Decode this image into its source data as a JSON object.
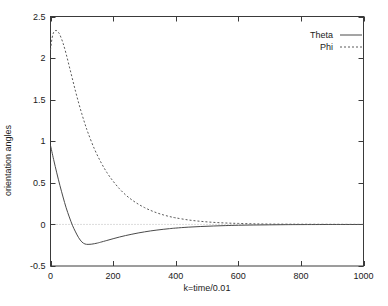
{
  "chart_data": {
    "type": "line",
    "title": "",
    "xlabel": "k=time/0.01",
    "ylabel": "orientation angles",
    "xlim": [
      0,
      1000
    ],
    "ylim": [
      -0.5,
      2.5
    ],
    "xticks": [
      0,
      200,
      400,
      600,
      800,
      1000
    ],
    "xtick_labels": [
      "0",
      "200",
      "400",
      "600",
      "800",
      "1000"
    ],
    "yticks": [
      -0.5,
      0,
      0.5,
      1,
      1.5,
      2,
      2.5
    ],
    "ytick_labels": [
      "-0.5",
      "0",
      "0.5",
      "1",
      "1.5",
      "2",
      "2.5"
    ],
    "grid": false,
    "zero_reference_line": true,
    "legend_position": "top-right",
    "legend": [
      "Theta",
      "Phi"
    ],
    "series": [
      {
        "name": "Theta",
        "style": "solid",
        "color": "#4a4a4a",
        "x": [
          0,
          10,
          20,
          30,
          40,
          50,
          60,
          70,
          80,
          90,
          100,
          110,
          120,
          130,
          140,
          150,
          160,
          180,
          200,
          220,
          240,
          260,
          280,
          300,
          320,
          340,
          360,
          380,
          400,
          440,
          480,
          520,
          560,
          600,
          650,
          700,
          750,
          800,
          900,
          1000
        ],
        "y": [
          0.95,
          0.78,
          0.62,
          0.47,
          0.33,
          0.2,
          0.09,
          -0.01,
          -0.09,
          -0.16,
          -0.21,
          -0.235,
          -0.24,
          -0.238,
          -0.232,
          -0.224,
          -0.214,
          -0.193,
          -0.172,
          -0.152,
          -0.134,
          -0.118,
          -0.103,
          -0.09,
          -0.078,
          -0.068,
          -0.059,
          -0.051,
          -0.044,
          -0.033,
          -0.025,
          -0.019,
          -0.014,
          -0.01,
          -0.007,
          -0.005,
          -0.003,
          -0.002,
          -0.001,
          -0.001
        ]
      },
      {
        "name": "Phi",
        "style": "dotted",
        "color": "#5a5a5a",
        "x": [
          0,
          5,
          10,
          15,
          20,
          25,
          30,
          40,
          50,
          60,
          70,
          80,
          90,
          100,
          110,
          120,
          140,
          160,
          180,
          200,
          220,
          240,
          260,
          280,
          300,
          320,
          340,
          360,
          380,
          400,
          440,
          480,
          520,
          560,
          600,
          650,
          700,
          750,
          800,
          900,
          1000
        ],
        "y": [
          2.1,
          2.24,
          2.31,
          2.33,
          2.33,
          2.31,
          2.28,
          2.18,
          2.05,
          1.9,
          1.75,
          1.6,
          1.46,
          1.33,
          1.21,
          1.1,
          0.91,
          0.755,
          0.625,
          0.52,
          0.43,
          0.355,
          0.295,
          0.245,
          0.203,
          0.168,
          0.139,
          0.115,
          0.095,
          0.079,
          0.054,
          0.037,
          0.025,
          0.017,
          0.012,
          0.007,
          0.004,
          0.003,
          0.002,
          0.001,
          0.0
        ]
      }
    ]
  },
  "axis": {
    "ylabel": "orientation angles",
    "xlabel": "k=time/0.01"
  },
  "legend": {
    "items": [
      {
        "label": "Theta",
        "style": "solid"
      },
      {
        "label": "Phi",
        "style": "dotted"
      }
    ]
  }
}
